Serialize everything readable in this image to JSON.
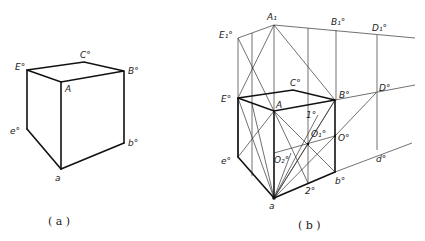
{
  "figure_a": {
    "caption": "( a )",
    "labels": {
      "E": "E°",
      "C": "C°",
      "B": "B°",
      "A": "A",
      "e": "e°",
      "b": "b°",
      "a": "a"
    }
  },
  "figure_b": {
    "caption": "( b )",
    "labels": {
      "A1": "A₁",
      "E1": "E₁°",
      "B1": "B₁°",
      "D1": "D₁°",
      "E": "E°",
      "C": "C°",
      "A": "A",
      "B": "B°",
      "D": "D°",
      "one": "1°",
      "O1": "O₁°",
      "O": "O°",
      "O2": "O₂°",
      "e": "e°",
      "d": "d°",
      "b": "b°",
      "two": "2°",
      "a": "a"
    }
  },
  "colors": {
    "line": "#111111",
    "background": "#ffffff"
  }
}
